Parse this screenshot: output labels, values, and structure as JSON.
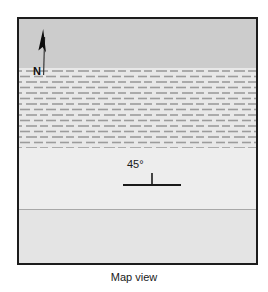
{
  "figure": {
    "caption": "Map view",
    "frame": {
      "border_color": "#1c1c1c",
      "background": "#f2f2f2"
    }
  },
  "north_arrow": {
    "icon": "north-arrow-icon",
    "label": "N",
    "color": "#111111"
  },
  "strike_dip": {
    "icon": "strike-dip-symbol-icon",
    "dip_label": "45°",
    "dip_degrees": 45,
    "color": "#1a1a1a"
  },
  "units": [
    {
      "name": "upper-unit",
      "fill": "#cccccc",
      "pattern": "solid",
      "top": 0,
      "height": 49
    },
    {
      "name": "hatched-unit",
      "fill": "#e8e8e8",
      "pattern": "dashed-horizontal",
      "dash_color": "#9a9a9a",
      "top": 49,
      "height": 80
    },
    {
      "name": "middle-unit",
      "fill": "#ededed",
      "pattern": "solid",
      "top": 129,
      "height": 61
    },
    {
      "name": "lower-unit",
      "fill": "#e4e4e4",
      "pattern": "solid",
      "top": 190,
      "height": 54
    }
  ],
  "contact_line": {
    "name": "geologic-contact",
    "color": "#a8a8a8"
  }
}
